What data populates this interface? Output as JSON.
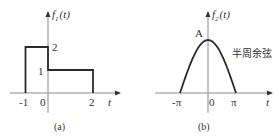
{
  "figures": [
    {
      "id": "a",
      "caption": "(a)",
      "ylabel_main": "f",
      "ylabel_sub": "1",
      "ylabel_arg": "(t)",
      "xlabel": "t",
      "xticks": [
        "-1",
        "0",
        "2"
      ],
      "yticks": [
        "1",
        "2"
      ],
      "type": "piecewise-rectangular",
      "segments": [
        {
          "t_start": -1,
          "t_end": 0,
          "value": 2
        },
        {
          "t_start": 0,
          "t_end": 2,
          "value": 1
        }
      ]
    },
    {
      "id": "b",
      "caption": "(b)",
      "ylabel_main": "f",
      "ylabel_sub": "2",
      "ylabel_arg": "(t)",
      "xlabel": "t",
      "xticks": [
        "-π",
        "0",
        "π"
      ],
      "peak_label": "A",
      "annotation": "半周余弦",
      "type": "half-cosine",
      "t_range": [
        "-π",
        "π"
      ]
    }
  ],
  "chart_data": [
    {
      "type": "line",
      "title": "(a)",
      "xlabel": "t",
      "ylabel": "f1(t)",
      "x": [
        -1,
        -1,
        0,
        0,
        2,
        2
      ],
      "y": [
        0,
        2,
        2,
        1,
        1,
        0
      ],
      "xticks": [
        -1,
        0,
        2
      ],
      "yticks": [
        1,
        2
      ],
      "grid": false
    },
    {
      "type": "line",
      "title": "(b)",
      "xlabel": "t",
      "ylabel": "f2(t)",
      "function": "A*cos(t/2) for -π ≤ t ≤ π",
      "x_range": [
        "-π",
        "π"
      ],
      "peak": {
        "x": 0,
        "y": "A"
      },
      "annotation": "半周余弦",
      "xticks": [
        "-π",
        "0",
        "π"
      ],
      "grid": false
    }
  ]
}
